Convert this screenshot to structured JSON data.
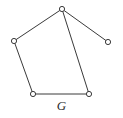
{
  "figure": {
    "label": "G",
    "caption_label": "G",
    "background_color": "#ffffff",
    "stroke_color": "#3a3a3a",
    "vertex_fill_color": "#ffffff",
    "label_color": "#2b2b2b",
    "width": 123,
    "height": 118
  },
  "graph": {
    "name": "G",
    "vertex_count": 5,
    "edge_count": 5,
    "vertices": [
      {
        "id": "v-top",
        "label": "",
        "x": 62,
        "y": 9,
        "r": 2.6
      },
      {
        "id": "v-left",
        "label": "",
        "x": 14,
        "y": 41,
        "r": 2.6
      },
      {
        "id": "v-right",
        "label": "",
        "x": 108,
        "y": 42,
        "r": 2.6
      },
      {
        "id": "v-bottom-left",
        "label": "",
        "x": 33,
        "y": 94,
        "r": 2.6
      },
      {
        "id": "v-bottom-right",
        "label": "",
        "x": 89,
        "y": 94,
        "r": 2.6
      }
    ],
    "edges": [
      {
        "id": "e-top-left",
        "from": "v-top",
        "to": "v-left"
      },
      {
        "id": "e-top-right",
        "from": "v-top",
        "to": "v-right"
      },
      {
        "id": "e-top-bottom-right",
        "from": "v-top",
        "to": "v-bottom-right"
      },
      {
        "id": "e-left-bottom-left",
        "from": "v-left",
        "to": "v-bottom-left"
      },
      {
        "id": "e-bottom",
        "from": "v-bottom-left",
        "to": "v-bottom-right"
      }
    ]
  }
}
